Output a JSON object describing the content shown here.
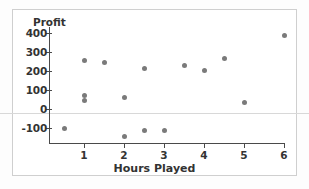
{
  "chart_data": {
    "type": "scatter",
    "title": "",
    "xlabel": "Hours Played",
    "ylabel": "Profit",
    "xlim": [
      0,
      6.4
    ],
    "ylim": [
      -160,
      430
    ],
    "xticks": [
      1,
      2,
      3,
      4,
      5,
      6
    ],
    "yticks": [
      400,
      300,
      200,
      100,
      0,
      -100
    ],
    "grid": false,
    "legend": null,
    "marker_color": "#7a7a7a",
    "axis_color": "#4a4a4a",
    "points": [
      {
        "x": 0.5,
        "y": -100
      },
      {
        "x": 1.0,
        "y": 255
      },
      {
        "x": 1.0,
        "y": 70
      },
      {
        "x": 1.0,
        "y": 45
      },
      {
        "x": 1.5,
        "y": 243
      },
      {
        "x": 2.0,
        "y": 58
      },
      {
        "x": 2.0,
        "y": -145
      },
      {
        "x": 2.5,
        "y": 212
      },
      {
        "x": 2.5,
        "y": -112
      },
      {
        "x": 3.0,
        "y": -112
      },
      {
        "x": 3.5,
        "y": 227
      },
      {
        "x": 4.0,
        "y": 202
      },
      {
        "x": 4.5,
        "y": 267
      },
      {
        "x": 5.0,
        "y": 32
      },
      {
        "x": 6.0,
        "y": 385
      }
    ]
  },
  "axes": {
    "y_title": "Profit",
    "x_title": "Hours Played",
    "y_tick_labels": [
      "400",
      "300",
      "200",
      "100",
      "0",
      "-100"
    ],
    "x_tick_labels": [
      "1",
      "2",
      "3",
      "4",
      "5",
      "6"
    ]
  }
}
